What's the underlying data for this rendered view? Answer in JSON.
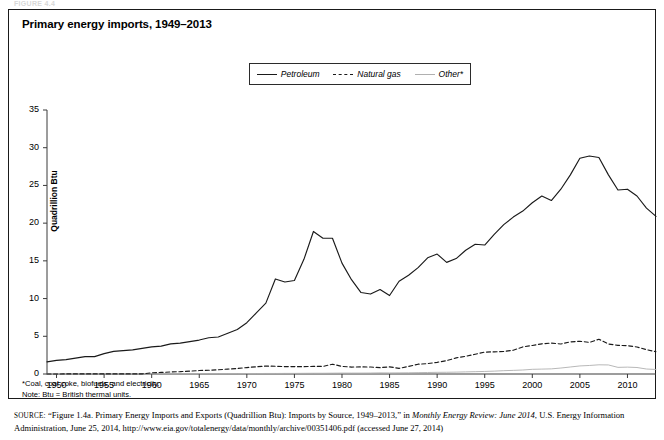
{
  "page": {
    "cut_header": "FIGURE 4.4"
  },
  "figure": {
    "title": "Primary energy imports, 1949–2013",
    "notes": [
      "*Coal, coal coke, biofuels, and electricity.",
      "Note: Btu = British thermal units."
    ],
    "source_label": "SOURCE:",
    "source_part1": "“Figure 1.4a. Primary Energy Imports and Exports (Quadrillion Btu): Imports by Source, 1949–2013,” in ",
    "source_italic": "Monthly Energy Review: June 2014",
    "source_part2": ", U.S. Energy Information Administration, June 25, 2014, http://www.eia.gov/totalenergy/data/monthly/archive/00351406.pdf (accessed June 27, 2014)"
  },
  "legend": {
    "position": "top-center",
    "entries": [
      {
        "label": "Petroleum",
        "style": "solid",
        "color": "#1a1a1a"
      },
      {
        "label": "Natural gas",
        "style": "dashed",
        "color": "#1a1a1a"
      },
      {
        "label": "Other*",
        "style": "light",
        "color": "#b0b0b0"
      }
    ]
  },
  "chart_data": {
    "type": "line",
    "title": "Primary energy imports, 1949–2013",
    "xlabel": "",
    "ylabel": "Quadrillion Btu",
    "xlim": [
      1949,
      2013
    ],
    "ylim": [
      0,
      35
    ],
    "yticks": [
      0,
      5,
      10,
      15,
      20,
      25,
      30,
      35
    ],
    "xticks": [
      1950,
      1955,
      1960,
      1965,
      1970,
      1975,
      1980,
      1985,
      1990,
      1995,
      2000,
      2005,
      2010
    ],
    "grid": false,
    "x": [
      1949,
      1950,
      1951,
      1952,
      1953,
      1954,
      1955,
      1956,
      1957,
      1958,
      1959,
      1960,
      1961,
      1962,
      1963,
      1964,
      1965,
      1966,
      1967,
      1968,
      1969,
      1970,
      1971,
      1972,
      1973,
      1974,
      1975,
      1976,
      1977,
      1978,
      1979,
      1980,
      1981,
      1982,
      1983,
      1984,
      1985,
      1986,
      1987,
      1988,
      1989,
      1990,
      1991,
      1992,
      1993,
      1994,
      1995,
      1996,
      1997,
      1998,
      1999,
      2000,
      2001,
      2002,
      2003,
      2004,
      2005,
      2006,
      2007,
      2008,
      2009,
      2010,
      2011,
      2012,
      2013
    ],
    "series": [
      {
        "name": "Petroleum",
        "style": "solid",
        "color": "#1a1a1a",
        "values": [
          1.6,
          1.8,
          1.9,
          2.1,
          2.3,
          2.3,
          2.7,
          3.0,
          3.1,
          3.2,
          3.4,
          3.6,
          3.7,
          4.0,
          4.1,
          4.3,
          4.5,
          4.8,
          4.9,
          5.4,
          5.9,
          6.8,
          8.1,
          9.4,
          12.6,
          12.2,
          12.4,
          15.2,
          18.9,
          18.0,
          18.0,
          14.7,
          12.5,
          10.8,
          10.6,
          11.2,
          10.4,
          12.3,
          13.1,
          14.1,
          15.4,
          15.9,
          14.8,
          15.3,
          16.4,
          17.2,
          17.1,
          18.5,
          19.8,
          20.8,
          21.6,
          22.7,
          23.6,
          23.0,
          24.5,
          26.4,
          28.6,
          28.9,
          28.7,
          26.4,
          24.4,
          24.5,
          23.6,
          22.0,
          20.9
        ]
      },
      {
        "name": "Natural gas",
        "style": "dashed",
        "color": "#1a1a1a",
        "values": [
          0.0,
          0.0,
          0.01,
          0.01,
          0.01,
          0.01,
          0.01,
          0.01,
          0.01,
          0.01,
          0.01,
          0.16,
          0.21,
          0.27,
          0.31,
          0.38,
          0.46,
          0.5,
          0.56,
          0.65,
          0.73,
          0.85,
          0.96,
          1.05,
          1.03,
          0.98,
          0.98,
          0.97,
          1.01,
          1.0,
          1.3,
          1.01,
          0.92,
          0.94,
          0.93,
          0.84,
          0.95,
          0.75,
          1.0,
          1.3,
          1.38,
          1.55,
          1.77,
          2.14,
          2.35,
          2.62,
          2.9,
          2.94,
          2.99,
          3.15,
          3.59,
          3.78,
          4.0,
          4.1,
          3.98,
          4.26,
          4.34,
          4.19,
          4.61,
          3.98,
          3.79,
          3.76,
          3.58,
          3.23,
          2.95
        ]
      },
      {
        "name": "Other*",
        "style": "light",
        "color": "#b0b0b0",
        "values": [
          0.02,
          0.02,
          0.02,
          0.02,
          0.02,
          0.02,
          0.03,
          0.03,
          0.03,
          0.03,
          0.03,
          0.04,
          0.04,
          0.04,
          0.04,
          0.04,
          0.05,
          0.05,
          0.05,
          0.05,
          0.05,
          0.06,
          0.06,
          0.07,
          0.07,
          0.08,
          0.08,
          0.09,
          0.1,
          0.1,
          0.11,
          0.12,
          0.12,
          0.12,
          0.13,
          0.15,
          0.14,
          0.15,
          0.16,
          0.18,
          0.2,
          0.22,
          0.23,
          0.25,
          0.28,
          0.31,
          0.34,
          0.38,
          0.44,
          0.48,
          0.53,
          0.62,
          0.65,
          0.68,
          0.79,
          0.93,
          1.07,
          1.13,
          1.22,
          1.2,
          0.88,
          0.91,
          0.86,
          0.66,
          0.6
        ]
      }
    ]
  }
}
